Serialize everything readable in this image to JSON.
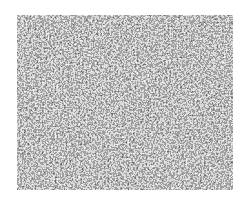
{
  "image": {
    "description": "Static / random noise texture in grayscale",
    "noise_region": {
      "x": 17,
      "y": 15,
      "width": 216,
      "height": 175
    },
    "colors": {
      "background": "#ffffff",
      "noise_dark": "#111111",
      "noise_light": "#f5f5f5"
    }
  },
  "ghost_text": {
    "top": "",
    "bottom": ""
  }
}
